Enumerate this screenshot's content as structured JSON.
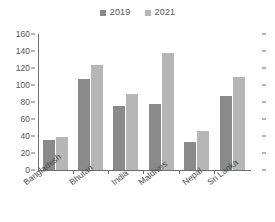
{
  "chart_data": {
    "type": "bar",
    "title": "",
    "xlabel": "",
    "ylabel": "",
    "categories": [
      "Bangladesh",
      "Bhutan",
      "India",
      "Maldives",
      "Nepal",
      "Sri Lanka"
    ],
    "series": [
      {
        "name": "2019",
        "color": "#8a8a8a",
        "values": [
          35,
          107,
          75,
          78,
          33,
          87
        ]
      },
      {
        "name": "2021",
        "color": "#b6b6b6",
        "values": [
          39,
          124,
          90,
          138,
          46,
          109
        ]
      }
    ],
    "ylim": [
      0,
      160
    ],
    "ytick_values": [
      0,
      20,
      40,
      60,
      80,
      100,
      120,
      140,
      160
    ],
    "ytick_labels": [
      "0",
      "20",
      "40",
      "60",
      "80",
      "100",
      "120",
      "140",
      "160"
    ],
    "grid": false,
    "legend_position": "top-center",
    "right_axis_ticks": true
  },
  "legend": {
    "entries": [
      {
        "label": "2019",
        "color": "#8a8a8a",
        "swatch_icon": "square-swatch-icon"
      },
      {
        "label": "2021",
        "color": "#b6b6b6",
        "swatch_icon": "square-swatch-icon"
      }
    ]
  }
}
